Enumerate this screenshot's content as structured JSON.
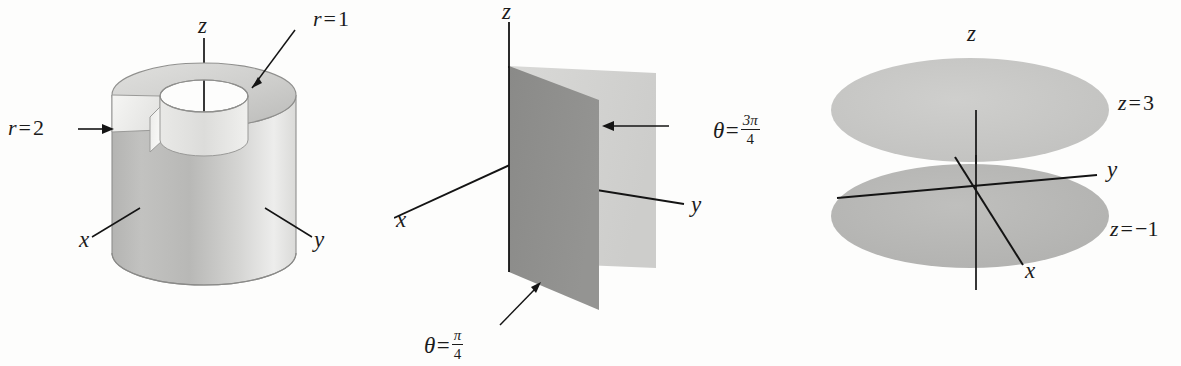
{
  "figure": {
    "background_color": "#fdfdfc",
    "ink_color": "#1b1b1b"
  },
  "panels": [
    {
      "id": "cylinder",
      "name": "annular-cylinder-panel",
      "surface_type": "r = constant cylinders",
      "labels": {
        "z_axis": "z",
        "x_axis": "x",
        "y_axis": "y",
        "inner_radius": {
          "lhs": "r",
          "op": "=",
          "rhs": "1"
        },
        "outer_radius": {
          "lhs": "r",
          "op": "=",
          "rhs": "2"
        }
      },
      "colors": {
        "outer_wall": "#c9c9c7",
        "outer_wall_light": "#ececeb",
        "inner_wall": "#e2e2e0",
        "top_annulus": "#d3d3d1",
        "cut_face": "#f2f2f0",
        "edge": "#8a8a88"
      }
    },
    {
      "id": "planes",
      "name": "theta-half-planes-panel",
      "surface_type": "theta = constant half-planes",
      "labels": {
        "z_axis": "z",
        "x_axis": "x",
        "y_axis": "y",
        "front_plane": {
          "lhs": "θ",
          "op": "=",
          "num": "π",
          "den": "4"
        },
        "back_plane": {
          "lhs": "θ",
          "op": "=",
          "num": "3π",
          "den": "4"
        }
      },
      "colors": {
        "front_plane_fill": "#8e8e8c",
        "back_plane_fill": "#d4d4d2",
        "axis": "#141414"
      }
    },
    {
      "id": "disks",
      "name": "z-constant-planes-panel",
      "surface_type": "z = constant planes",
      "labels": {
        "z_axis": "z",
        "x_axis": "x",
        "y_axis": "y",
        "upper_plane": {
          "lhs": "z",
          "op": "=",
          "rhs": "3"
        },
        "lower_plane": {
          "lhs": "z",
          "op": "=",
          "rhs": "−1"
        }
      },
      "colors": {
        "upper_disk": "#c6c6c4",
        "lower_disk": "#b6b6b4",
        "axis": "#141414"
      }
    }
  ]
}
